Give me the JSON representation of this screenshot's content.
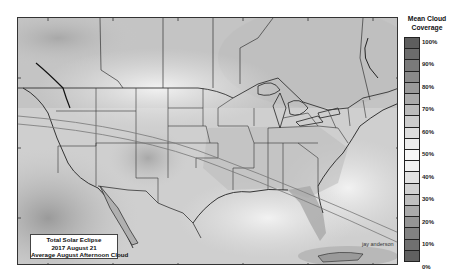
{
  "caption": {
    "line1": "Total Solar Eclipse",
    "line2": "2017 August 21",
    "line3": "Average August Afternoon Cloud"
  },
  "credit": "jay anderson",
  "legend": {
    "title_line1": "Mean Cloud",
    "title_line2": "Coverage",
    "labels": [
      "100%",
      "90%",
      "80%",
      "70%",
      "60%",
      "50%",
      "40%",
      "30%",
      "20%",
      "10%",
      "0%"
    ],
    "segment_colors": [
      "#5e5e5e",
      "#6c6c6c",
      "#7a7a7a",
      "#8a8a8a",
      "#9a9a9a",
      "#ababab",
      "#bcbcbc",
      "#cdcdcd",
      "#dedede",
      "#ededed",
      "#f7f7f7",
      "#f2f2f2",
      "#e3e3e3",
      "#d2d2d2",
      "#bfbfbf",
      "#aaaaaa",
      "#959595",
      "#828282",
      "#707070",
      "#606060"
    ]
  },
  "map": {
    "region": "North America (USA, southern Canada, northern Mexico)",
    "feature": "2017 total solar eclipse path of totality"
  }
}
